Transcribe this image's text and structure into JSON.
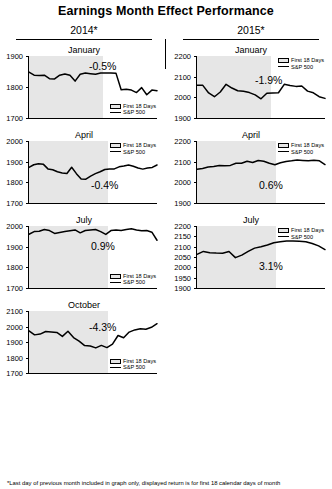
{
  "title": "Earnings Month Effect Performance",
  "footnote": "*Last day of previous month included in graph only, displayed return is for first 18 calendar days of month",
  "legend": {
    "shaded_label": "First 18 Days",
    "line_label": "S&P 500"
  },
  "columns": [
    {
      "header": "2014*"
    },
    {
      "header": "2015*"
    }
  ],
  "chart_data": [
    {
      "type": "line",
      "title": "January",
      "year": "2014*",
      "ylabel": "",
      "xlabel": "",
      "ylim": [
        1700,
        1900
      ],
      "yticks": [
        1900,
        1800,
        1700
      ],
      "grid": false,
      "legend_position": "bottom-right",
      "annotation": "-0.5%",
      "shaded_region_label": "First 18 Days",
      "shaded_fraction": 0.58,
      "series": [
        {
          "name": "S&P 500",
          "values": [
            1848,
            1838,
            1837,
            1838,
            1827,
            1826,
            1838,
            1842,
            1838,
            1819,
            1841,
            1845,
            1843,
            1841,
            1845,
            1845,
            1845,
            1844,
            1791,
            1793,
            1790,
            1782,
            1798,
            1775,
            1790,
            1788
          ]
        }
      ]
    },
    {
      "type": "line",
      "title": "January",
      "year": "2015*",
      "ylim": [
        1900,
        2200
      ],
      "yticks": [
        2200,
        2100,
        2000,
        1900
      ],
      "grid": false,
      "legend_position": "top-right",
      "annotation": "-1.9%",
      "shaded_fraction": 0.58,
      "series": [
        {
          "name": "S&P 500",
          "values": [
            2059,
            2058,
            2021,
            2003,
            2026,
            2063,
            2045,
            2032,
            2029,
            2023,
            2012,
            1993,
            2020,
            2021,
            2022,
            2063,
            2057,
            2053,
            2055,
            2030,
            2022,
            2003,
            1995
          ]
        }
      ]
    },
    {
      "type": "line",
      "title": "April",
      "year": "2014*",
      "ylim": [
        1700,
        2000
      ],
      "yticks": [
        2000,
        1900,
        1800,
        1700
      ],
      "grid": false,
      "legend_position": "top-right",
      "annotation": "-0.4%",
      "shaded_fraction": 0.62,
      "series": [
        {
          "name": "S&P 500",
          "values": [
            1872,
            1885,
            1890,
            1888,
            1865,
            1861,
            1851,
            1845,
            1843,
            1873,
            1842,
            1816,
            1815,
            1830,
            1842,
            1851,
            1862,
            1864,
            1865,
            1875,
            1879,
            1884,
            1878,
            1869,
            1864,
            1869,
            1872,
            1884
          ]
        }
      ]
    },
    {
      "type": "line",
      "title": "April",
      "year": "2015*",
      "ylim": [
        1900,
        2200
      ],
      "yticks": [
        2200,
        2100,
        2000,
        1900
      ],
      "grid": false,
      "legend_position": "top-right",
      "annotation": "0.6%",
      "shaded_fraction": 0.62,
      "series": [
        {
          "name": "S&P 500",
          "values": [
            2063,
            2067,
            2074,
            2077,
            2081,
            2080,
            2082,
            2092,
            2092,
            2102,
            2096,
            2106,
            2102,
            2092,
            2085,
            2095,
            2101,
            2104,
            2108,
            2106,
            2104,
            2107,
            2104,
            2086
          ]
        }
      ]
    },
    {
      "type": "line",
      "title": "July",
      "year": "2014*",
      "ylim": [
        1700,
        2000
      ],
      "yticks": [
        2000,
        1900,
        1800,
        1700
      ],
      "grid": false,
      "legend_position": "bottom-right",
      "annotation": "0.9%",
      "shaded_fraction": 0.62,
      "series": [
        {
          "name": "S&P 500",
          "values": [
            1960,
            1973,
            1975,
            1983,
            1978,
            1964,
            1969,
            1973,
            1977,
            1981,
            1967,
            1978,
            1981,
            1983,
            1973,
            1959,
            1978,
            1981,
            1978,
            1983,
            1987,
            1981,
            1977,
            1978,
            1970,
            1931
          ]
        }
      ]
    },
    {
      "type": "line",
      "title": "July",
      "year": "2015*",
      "ylim": [
        1900,
        2200
      ],
      "yticks": [
        2200,
        2150,
        2100,
        2050,
        2000,
        1950,
        1900
      ],
      "grid": false,
      "legend_position": "top-right",
      "annotation": "3.1%",
      "shaded_fraction": 0.62,
      "series": [
        {
          "name": "S&P 500",
          "values": [
            2063,
            2077,
            2071,
            2069,
            2068,
            2077,
            2047,
            2059,
            2077,
            2093,
            2100,
            2108,
            2119,
            2124,
            2127,
            2128,
            2126,
            2124,
            2115,
            2104,
            2086
          ]
        }
      ]
    },
    {
      "type": "line",
      "title": "October",
      "year": "2014*",
      "ylim": [
        1700,
        2100
      ],
      "yticks": [
        2100,
        2000,
        1900,
        1800,
        1700
      ],
      "grid": false,
      "legend_position": "bottom-right",
      "annotation": "-4.3%",
      "shaded_fraction": 0.62,
      "series": [
        {
          "name": "S&P 500",
          "values": [
            1972,
            1946,
            1951,
            1968,
            1965,
            1962,
            1936,
            1969,
            1929,
            1906,
            1877,
            1874,
            1862,
            1878,
            1864,
            1886,
            1942,
            1927,
            1964,
            1978,
            1985,
            1982,
            1995,
            2018
          ]
        }
      ]
    }
  ]
}
